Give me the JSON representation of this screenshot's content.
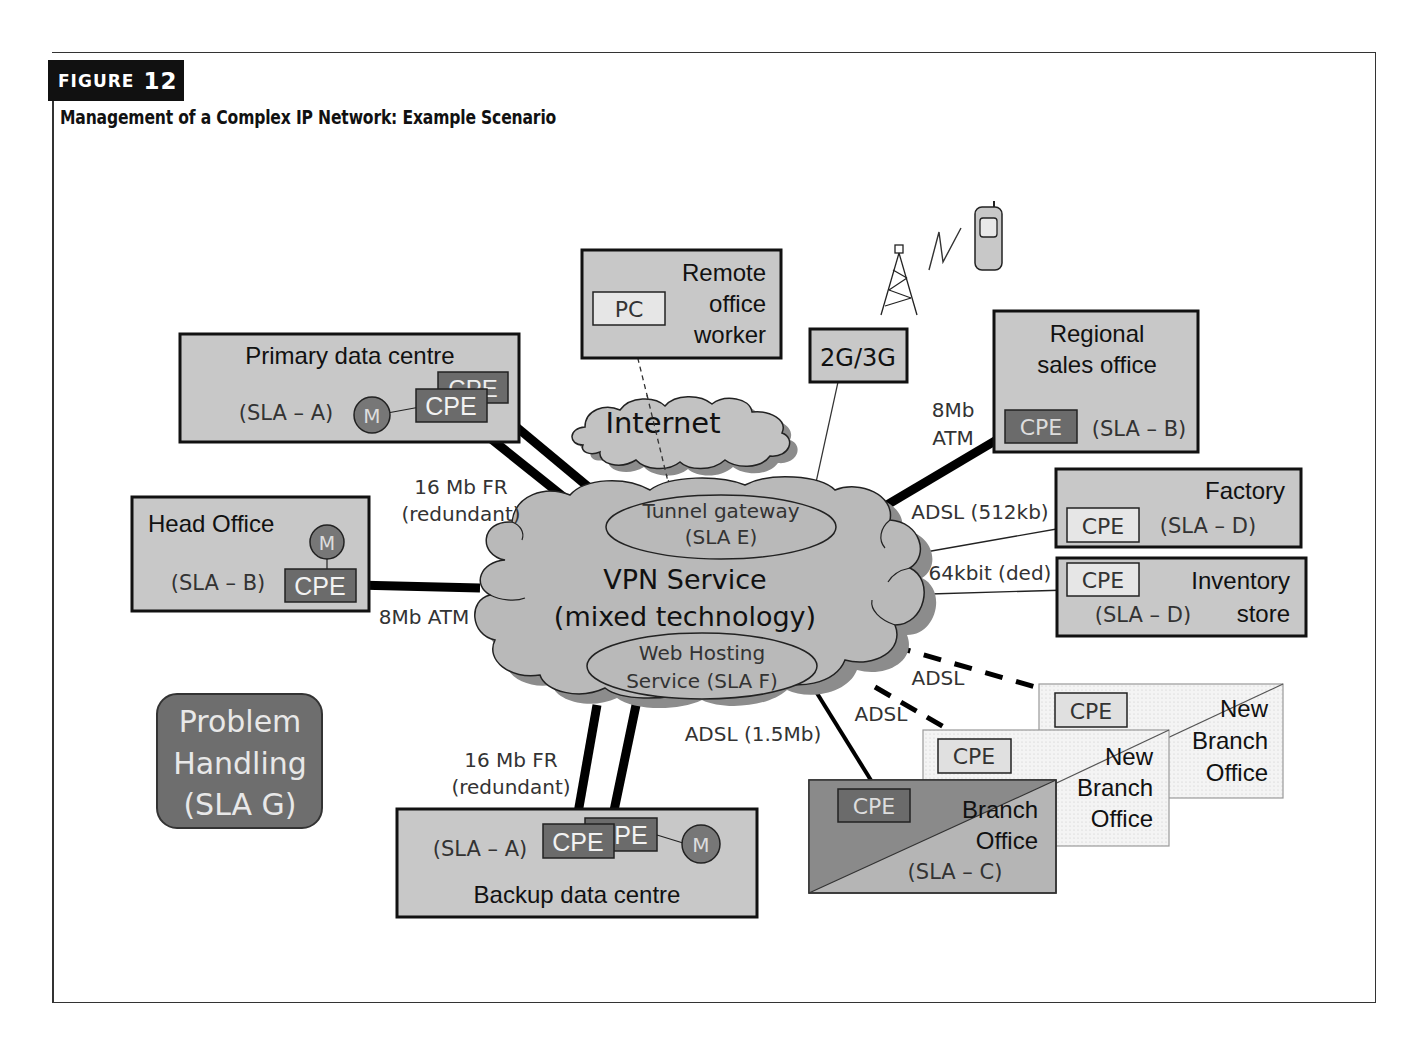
{
  "figure": {
    "badge_word": "FIGURE",
    "badge_number": "12",
    "title": "Management of a Complex IP Network: Example Scenario"
  },
  "colors": {
    "box_fill": "#c8c8c8",
    "cpe_dark": "#6b6b6b",
    "cpe_light": "#e4e4e4",
    "cloud_fill": "#b9b9b9",
    "cloud_shadow": "#8c8c8c",
    "problem_fill": "#6e6e6e",
    "monitor_fill": "#777777",
    "link_color": "#000000"
  },
  "sites": {
    "primary_dc": {
      "name": "Primary data centre",
      "sla": "(SLA – A)",
      "cpe": "CPE",
      "monitor": "M"
    },
    "head_office": {
      "name": "Head Office",
      "sla": "(SLA – B)",
      "cpe": "CPE",
      "monitor": "M"
    },
    "remote_worker": {
      "line1": "Remote",
      "line2": "office",
      "line3": "worker",
      "pc": "PC"
    },
    "mobile": {
      "label": "2G/3G"
    },
    "regional_sales": {
      "line1": "Regional",
      "line2": "sales office",
      "sla": "(SLA – B)",
      "cpe": "CPE"
    },
    "factory": {
      "name": "Factory",
      "sla": "(SLA – D)",
      "cpe": "CPE"
    },
    "inventory": {
      "line1": "Inventory",
      "line2": "store",
      "sla": "(SLA – D)",
      "cpe": "CPE"
    },
    "backup_dc": {
      "name": "Backup data centre",
      "sla": "(SLA – A)",
      "cpe": "CPE",
      "cpe2": "PE",
      "monitor": "M"
    },
    "branch": {
      "line1": "Branch",
      "line2": "Office",
      "sla": "(SLA – C)",
      "cpe": "CPE"
    },
    "new_branch_1": {
      "line1": "New",
      "line2": "Branch",
      "line3": "Office",
      "cpe": "CPE"
    },
    "new_branch_2": {
      "line1": "New",
      "line2": "Branch",
      "line3": "Office",
      "cpe": "CPE"
    }
  },
  "clouds": {
    "internet": {
      "label": "Internet"
    },
    "vpn": {
      "line1": "VPN Service",
      "line2": "(mixed technology)",
      "tunnel_line1": "Tunnel gateway",
      "tunnel_line2": "(SLA E)",
      "web_line1": "Web Hosting",
      "web_line2": "Service (SLA F)"
    }
  },
  "problem_handling": {
    "line1": "Problem",
    "line2": "Handling",
    "line3": "(SLA G)"
  },
  "links": {
    "primary": {
      "line1": "16 Mb FR",
      "line2": "(redundant)"
    },
    "head_office": {
      "label": "8Mb ATM"
    },
    "regional": {
      "line1": "8Mb",
      "line2": "ATM"
    },
    "factory": {
      "label": "ADSL (512kb)"
    },
    "inventory": {
      "label": "64kbit (ded)"
    },
    "new_branch_far": {
      "label": "ADSL"
    },
    "new_branch_near": {
      "label": "ADSL"
    },
    "branch": {
      "label": "ADSL (1.5Mb)"
    },
    "backup": {
      "line1": "16 Mb FR",
      "line2": "(redundant)"
    }
  }
}
